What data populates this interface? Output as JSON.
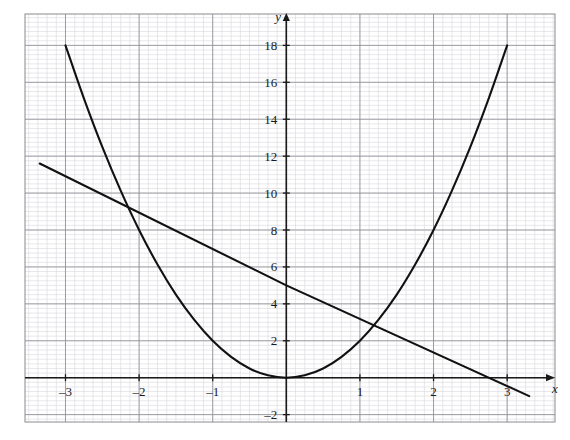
{
  "chart_data": {
    "type": "line",
    "title": "",
    "subtitle": "",
    "xlabel": "x",
    "ylabel": "y",
    "xlim": [
      -3.55,
      3.65
    ],
    "ylim": [
      -2.4,
      19.7
    ],
    "grid": true,
    "grid_minor_step": 0.125,
    "grid_major_step_x": 1,
    "grid_major_step_y": 2,
    "legend_position": "none",
    "xticks": [
      -3,
      -2,
      -1,
      1,
      2,
      3
    ],
    "xtick_labels": [
      "–3",
      "–2",
      "–1",
      "1",
      "2",
      "3"
    ],
    "yticks": [
      -2,
      2,
      4,
      6,
      8,
      10,
      12,
      14,
      16,
      18
    ],
    "ytick_labels": [
      "–2",
      "2",
      "4",
      "6",
      "8",
      "10",
      "12",
      "14",
      "16",
      "18"
    ],
    "series": [
      {
        "name": "parabola",
        "kind": "curve",
        "equation": "y = 2x^2",
        "color": "#111111",
        "x_range": [
          -3.0,
          3.0
        ],
        "points": [
          {
            "x": -3.0,
            "y": 18.0
          },
          {
            "x": -2.75,
            "y": 15.13
          },
          {
            "x": -2.5,
            "y": 12.5
          },
          {
            "x": -2.25,
            "y": 10.13
          },
          {
            "x": -2.0,
            "y": 8.0
          },
          {
            "x": -1.75,
            "y": 6.13
          },
          {
            "x": -1.5,
            "y": 4.5
          },
          {
            "x": -1.25,
            "y": 3.13
          },
          {
            "x": -1.0,
            "y": 2.0
          },
          {
            "x": -0.75,
            "y": 1.13
          },
          {
            "x": -0.5,
            "y": 0.5
          },
          {
            "x": -0.25,
            "y": 0.13
          },
          {
            "x": 0.0,
            "y": 0.0
          },
          {
            "x": 0.25,
            "y": 0.13
          },
          {
            "x": 0.5,
            "y": 0.5
          },
          {
            "x": 0.75,
            "y": 1.13
          },
          {
            "x": 1.0,
            "y": 2.0
          },
          {
            "x": 1.25,
            "y": 3.13
          },
          {
            "x": 1.5,
            "y": 4.5
          },
          {
            "x": 1.75,
            "y": 6.13
          },
          {
            "x": 2.0,
            "y": 8.0
          },
          {
            "x": 2.25,
            "y": 10.13
          },
          {
            "x": 2.5,
            "y": 12.5
          },
          {
            "x": 2.75,
            "y": 15.13
          },
          {
            "x": 3.0,
            "y": 18.0
          }
        ]
      },
      {
        "name": "line",
        "kind": "line",
        "equation": "y = -x + 5",
        "color": "#111111",
        "x_range": [
          -3.35,
          3.3
        ],
        "points": [
          {
            "x": -3.35,
            "y": 11.6
          },
          {
            "x": 0.0,
            "y": 5.0
          },
          {
            "x": 3.3,
            "y": -1.0
          }
        ]
      }
    ],
    "intersections": [
      {
        "x": -1.85,
        "y": 6.85
      },
      {
        "x": 1.35,
        "y": 3.65
      }
    ],
    "annotations": []
  },
  "axes": {
    "x_axis_label": "x",
    "y_axis_label": "y",
    "origin_label": ""
  },
  "colors": {
    "curve": "#111111",
    "axis": "#1a1a1a",
    "grid_major": "#8f8f96",
    "grid_minor": "#d7d7de",
    "frame": "#8a8a90",
    "background": "#ffffff"
  }
}
